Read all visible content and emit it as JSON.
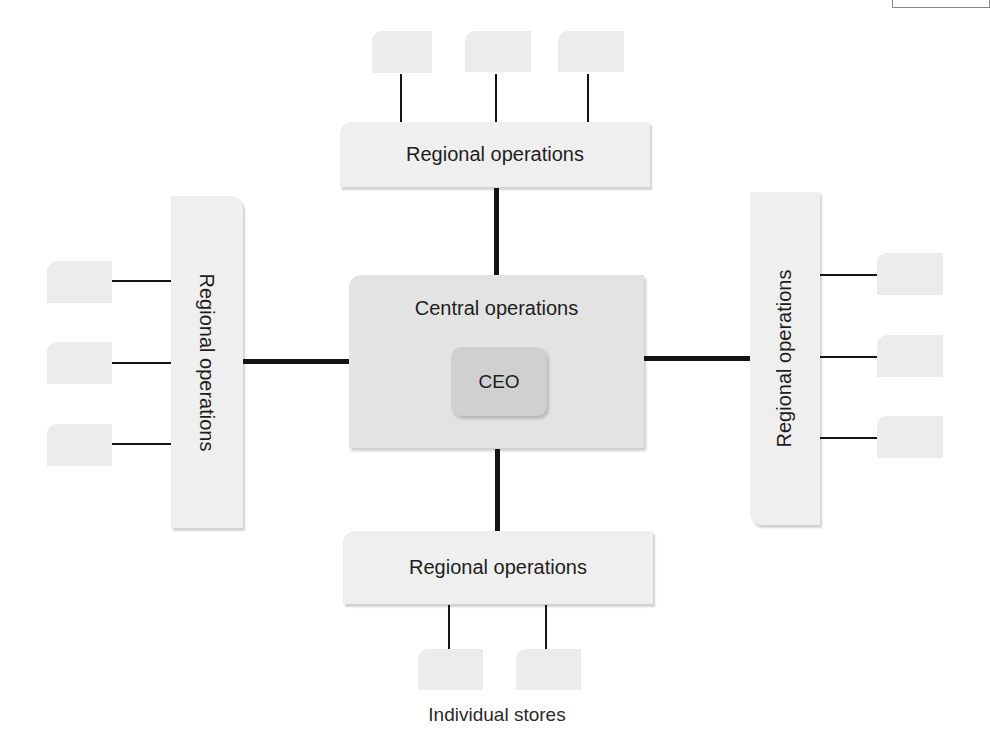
{
  "diagram": {
    "type": "org-structure",
    "central": {
      "title": "Central operations",
      "ceo_label": "CEO"
    },
    "regions": {
      "top": {
        "label": "Regional operations",
        "store_count": 3
      },
      "left": {
        "label": "Regional operations",
        "store_count": 3
      },
      "right": {
        "label": "Regional operations",
        "store_count": 3
      },
      "bottom": {
        "label": "Regional operations",
        "store_count": 2
      }
    },
    "caption": "Individual stores",
    "colors": {
      "store_fill": "#ececec",
      "region_fill": "#efefef",
      "central_fill": "#e3e3e3",
      "ceo_fill": "#d0d0d0",
      "connector": "#141414"
    }
  }
}
